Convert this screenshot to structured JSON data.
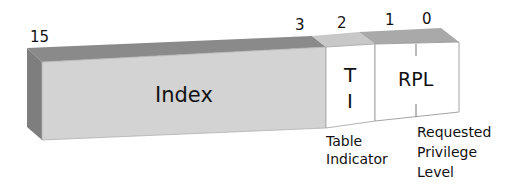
{
  "diagram": {
    "bit_labels": {
      "b15": "15",
      "b3": "3",
      "b2": "2",
      "b1": "1",
      "b0": "0"
    },
    "fields": {
      "index": {
        "label": "Index"
      },
      "ti": {
        "label_line1": "T",
        "label_line2": "I"
      },
      "rpl": {
        "label": "RPL"
      }
    },
    "descriptions": {
      "ti": {
        "line1": "Table",
        "line2": "Indicator"
      },
      "rpl": {
        "line1": "Requested",
        "line2": "Privilege",
        "line3": "Level"
      }
    },
    "colors": {
      "index_front": "#d3d3d3",
      "index_top": "#8a8a8a",
      "left_face": "#7e7e7e",
      "ti_top": "#c8c8c8",
      "rpl_top": "#a9a9a9",
      "white_front": "#ffffff",
      "edge": "#9a9a9a"
    }
  }
}
